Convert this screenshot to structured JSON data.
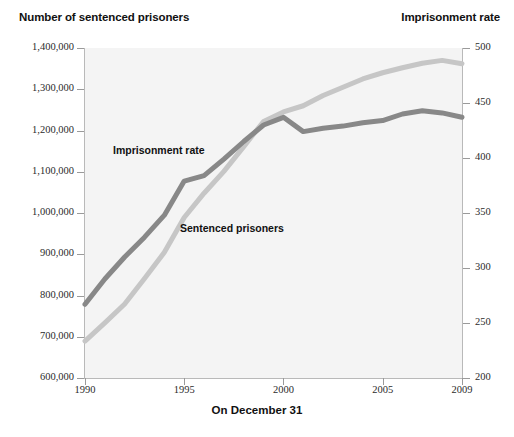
{
  "header": {
    "left_title": "Number of sentenced prisoners",
    "right_title": "Imprisonment rate"
  },
  "axis": {
    "x_title": "On December 31",
    "x_ticks": [
      "1990",
      "1995",
      "2000",
      "2005",
      "2009"
    ],
    "y_left_ticks": [
      "1,400,000",
      "1,300,000",
      "1,200,000",
      "1,100,000",
      "1,000,000",
      "900,000",
      "800,000",
      "700,000",
      "600,000"
    ],
    "y_right_ticks": [
      "500",
      "450",
      "400",
      "350",
      "300",
      "250",
      "200"
    ]
  },
  "annotations": {
    "rate_label": "Imprisonment rate",
    "prisoners_label": "Sentenced prisoners"
  },
  "colors": {
    "imprisonment_rate_line": "#888888",
    "sentenced_prisoners_line": "#c6c6c6",
    "plot_background": "#f4f4f4",
    "axis": "#b9b9b9",
    "text": "#111111"
  },
  "chart_data": {
    "type": "line",
    "xlabel": "On December 31",
    "ylabel": "Number of sentenced prisoners",
    "y2label": "Imprisonment rate",
    "grid": false,
    "legend": "inline-labels",
    "x": [
      1990,
      1991,
      1992,
      1993,
      1994,
      1995,
      1996,
      1997,
      1998,
      1999,
      2000,
      2001,
      2002,
      2003,
      2004,
      2005,
      2006,
      2007,
      2008,
      2009
    ],
    "xlim": [
      1990,
      2009
    ],
    "ylim": [
      600000,
      1400000
    ],
    "y2lim": [
      200,
      500
    ],
    "series": [
      {
        "name": "Sentenced prisoners",
        "axis": "left",
        "color": "#c6c6c6",
        "values": [
          689577,
          733757,
          779492,
          841179,
          904647,
          989007,
          1048000,
          1100850,
          1161000,
          1222000,
          1245000,
          1260000,
          1285000,
          1305000,
          1325000,
          1340000,
          1352000,
          1363000,
          1370000,
          1362000
        ]
      },
      {
        "name": "Imprisonment rate",
        "axis": "right",
        "color": "#888888",
        "values": [
          267,
          290,
          310,
          328,
          348,
          379,
          384,
          399,
          415,
          430,
          437,
          424,
          427,
          429,
          432,
          434,
          440,
          443,
          441,
          437
        ]
      }
    ]
  }
}
